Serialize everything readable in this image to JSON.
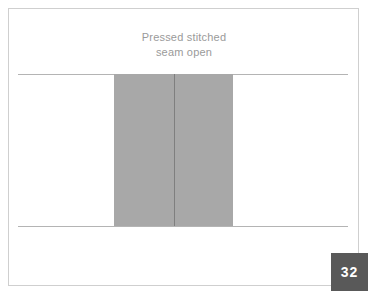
{
  "figure": {
    "caption": "Pressed stitched\nseam open",
    "page_number": "32",
    "colors": {
      "background": "#ffffff",
      "frame_border": "#cfcfcf",
      "caption_text": "#9a9a9a",
      "fabric_line": "#b4b4b4",
      "seam_allowance_fill": "#a8a8a8",
      "seam_stitch_line": "#7f7f7f",
      "badge_background": "#595959",
      "badge_text": "#ffffff"
    },
    "parts": {
      "fabric_line_top": "fabric-plane-top-edge",
      "fabric_line_bottom": "fabric-plane-bottom-edge",
      "seam_allowance_block": "seam-allowance-pressed-open",
      "stitch_line": "center-stitched-seam"
    }
  }
}
